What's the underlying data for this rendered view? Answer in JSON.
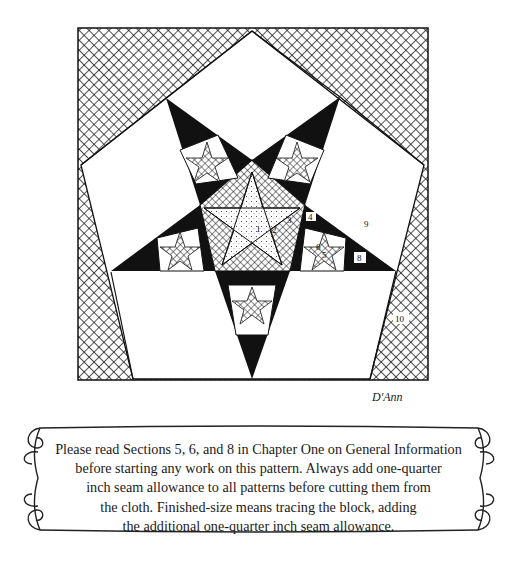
{
  "figure": {
    "piece_labels": [
      "1",
      "2",
      "3",
      "4",
      "5",
      "6",
      "7",
      "8",
      "9",
      "10"
    ],
    "signature": "D'Ann"
  },
  "note": {
    "lines": [
      "Please read Sections 5, 6, and 8 in Chapter One on General Information",
      "before starting any work on this pattern. Always add one-quarter",
      "inch seam allowance to all patterns before cutting them from",
      "the cloth. Finished-size means tracing the block, adding",
      "the additional one-quarter inch seam allowance."
    ]
  },
  "colors": {
    "ink": "#111111",
    "paper": "#ffffff"
  }
}
